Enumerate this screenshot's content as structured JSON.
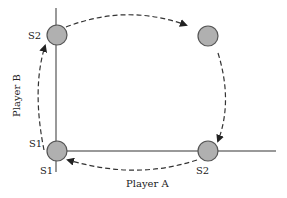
{
  "diagram": {
    "axes": {
      "x_label": "Player A",
      "y_label": "Player B"
    },
    "nodes": [
      {
        "id": "bottom-left",
        "labels": [
          "S1",
          "S1"
        ]
      },
      {
        "id": "top-left",
        "labels": [
          "S2"
        ]
      },
      {
        "id": "top-right",
        "labels": []
      },
      {
        "id": "bottom-right",
        "labels": [
          "S2"
        ]
      }
    ],
    "labels": {
      "top_left": "S2",
      "bottom_left_upper": "S1",
      "bottom_left_lower": "S1",
      "bottom_right": "S2"
    },
    "cycle": [
      "bottom-left",
      "top-left",
      "top-right",
      "bottom-right",
      "bottom-left"
    ],
    "colors": {
      "node_fill": "#b0b0b0",
      "node_stroke": "#555555",
      "axis": "#777777",
      "arrow": "#333333"
    }
  }
}
